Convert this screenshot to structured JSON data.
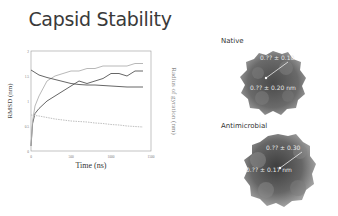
{
  "slide": {
    "title": "Capsid Stability"
  },
  "chart_data": {
    "type": "line",
    "title": "",
    "xlabel": "Time (ns)",
    "ylabel": "RMSD (nm)",
    "y2label": "Radius of gyration (nm)",
    "xlim": [
      0,
      1500
    ],
    "ylim": [
      0,
      2
    ],
    "x_ticks": [
      "0",
      "500",
      "1000",
      "1500"
    ],
    "y_ticks": [
      "0",
      "0.5",
      "1",
      "1.5",
      "2"
    ],
    "grid": false,
    "series": [
      {
        "name": "RMSD (dark, rising)",
        "axis": "left",
        "color": "#555555",
        "x": [
          0,
          20,
          50,
          100,
          200,
          300,
          400,
          500,
          600,
          700,
          800,
          900,
          1000,
          1100,
          1200,
          1300,
          1400
        ],
        "values": [
          0.1,
          0.55,
          0.75,
          0.85,
          1.0,
          1.1,
          1.2,
          1.3,
          1.4,
          1.35,
          1.4,
          1.45,
          1.55,
          1.55,
          1.5,
          1.6,
          1.6
        ]
      },
      {
        "name": "RMSD (light, rising)",
        "axis": "left",
        "color": "#b0b0b0",
        "x": [
          0,
          20,
          50,
          100,
          200,
          300,
          400,
          500,
          600,
          700,
          800,
          900,
          1000,
          1100,
          1200,
          1300,
          1400
        ],
        "values": [
          0.1,
          0.6,
          0.9,
          1.1,
          1.4,
          1.5,
          1.55,
          1.6,
          1.6,
          1.65,
          1.65,
          1.7,
          1.7,
          1.7,
          1.7,
          1.75,
          1.75
        ]
      },
      {
        "name": "Rg (dark, decreasing)",
        "axis": "right",
        "color": "#555555",
        "x": [
          0,
          100,
          200,
          300,
          400,
          500,
          600,
          700,
          800,
          900,
          1000,
          1100,
          1200,
          1300,
          1400
        ],
        "values": [
          1.62,
          1.52,
          1.47,
          1.43,
          1.39,
          1.35,
          1.33,
          1.32,
          1.32,
          1.31,
          1.3,
          1.29,
          1.28,
          1.28,
          1.28
        ]
      },
      {
        "name": "Rg (light, decreasing)",
        "axis": "right",
        "color": "#b8b8b8",
        "x": [
          0,
          100,
          200,
          300,
          400,
          500,
          600,
          700,
          800,
          900,
          1000,
          1100,
          1200,
          1300,
          1400
        ],
        "values": [
          0.72,
          0.7,
          0.67,
          0.64,
          0.62,
          0.6,
          0.59,
          0.58,
          0.56,
          0.55,
          0.53,
          0.52,
          0.5,
          0.49,
          0.48
        ]
      }
    ]
  },
  "panels": {
    "native": {
      "label": "Native",
      "measure_top": "0.?? ± 0.10",
      "measure_bottom": "0.?? ± 0.20 nm"
    },
    "antimicrobial": {
      "label": "Antimicrobial",
      "measure_top": "0.?? ± 0.30",
      "measure_bottom": "0.?? ± 0.17 nm"
    }
  }
}
